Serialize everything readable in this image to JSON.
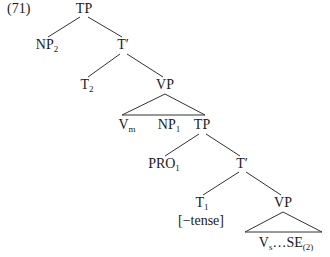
{
  "example_number": "(71)",
  "tree": {
    "root": {
      "label": "TP"
    },
    "np2": {
      "label": "NP",
      "sub": "2"
    },
    "tbar_upper": {
      "label": "T′"
    },
    "t2": {
      "label": "T",
      "sub": "2"
    },
    "vp_upper": {
      "label": "VP"
    },
    "vm": {
      "label": "V",
      "sub": "m"
    },
    "np1": {
      "label": "NP",
      "sub": "1"
    },
    "tp_lower": {
      "label": "TP"
    },
    "pro1": {
      "label": "PRO",
      "sub": "1"
    },
    "tbar_lower": {
      "label": "T′"
    },
    "t1": {
      "label": "T",
      "sub": "1"
    },
    "t1_feature": "[−tense]",
    "vp_lower": {
      "label": "VP"
    },
    "vs_se": {
      "label_a": "V",
      "sub_a": "s",
      "mid": "…SE",
      "sub_b": "(2)"
    }
  },
  "colors": {
    "line": "#333333",
    "text": "#1a1a1a",
    "background": "#ffffff"
  }
}
